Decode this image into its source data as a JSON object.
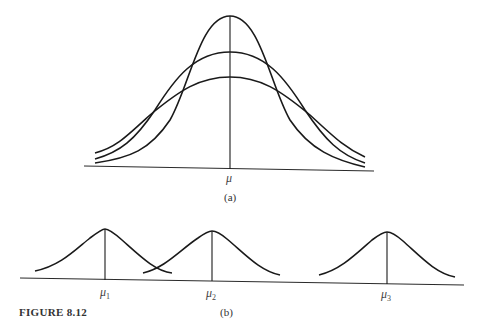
{
  "figure": {
    "caption": "FIGURE 8.12",
    "panel_a": {
      "label": "(a)",
      "mean_label": "μ",
      "curves": [
        {
          "name": "narrow-tall",
          "peak_y": 16
        },
        {
          "name": "medium",
          "peak_y": 52
        },
        {
          "name": "wide-flat",
          "peak_y": 77
        }
      ]
    },
    "panel_b": {
      "label": "(b)",
      "means": [
        {
          "symbol": "μ",
          "subscript": "1"
        },
        {
          "symbol": "μ",
          "subscript": "2"
        },
        {
          "symbol": "μ",
          "subscript": "3"
        }
      ]
    }
  }
}
